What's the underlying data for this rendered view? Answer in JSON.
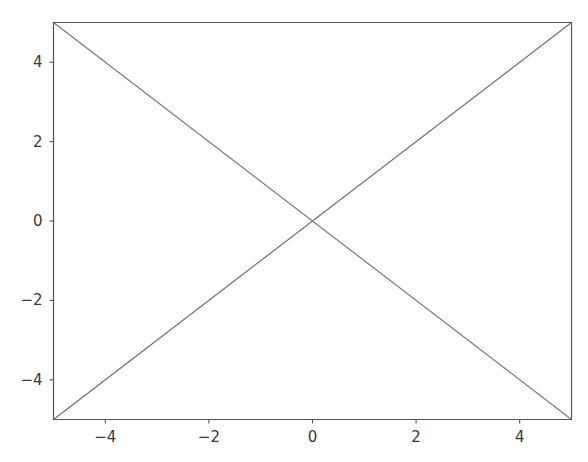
{
  "figure": {
    "background_color": "#ffffff",
    "width": 588,
    "height": 462
  },
  "chart_data": {
    "type": "line",
    "title": "",
    "subtitle": "",
    "xlabel": "",
    "ylabel": "",
    "xlim": [
      -5,
      5
    ],
    "ylim": [
      -5,
      5
    ],
    "grid": false,
    "legend": false,
    "legend_position": "none",
    "x_ticks": [
      -4,
      -2,
      0,
      2,
      4
    ],
    "y_ticks": [
      -4,
      -2,
      0,
      2,
      4
    ],
    "x_tick_labels": [
      "−4",
      "−2",
      "0",
      "2",
      "4"
    ],
    "y_tick_labels": [
      "−4",
      "−2",
      "0",
      "2",
      "4"
    ],
    "series": [
      {
        "name": "y = x",
        "color": "#6e6e6e",
        "linewidth": 1.2,
        "x": [
          -5,
          5
        ],
        "values": [
          -5,
          5
        ]
      },
      {
        "name": "y = -x",
        "color": "#7a7a7a",
        "linewidth": 1.2,
        "x": [
          -5,
          5
        ],
        "values": [
          5,
          -5
        ]
      }
    ],
    "annotations": [],
    "axes_color": "#555555",
    "tick_color": "#555555",
    "tick_label_color": "#3a3a3a"
  },
  "axes": {
    "spine_top_name": "top-spine",
    "spine_bottom_name": "bottom-spine",
    "spine_left_name": "left-spine",
    "spine_right_name": "right-spine"
  }
}
